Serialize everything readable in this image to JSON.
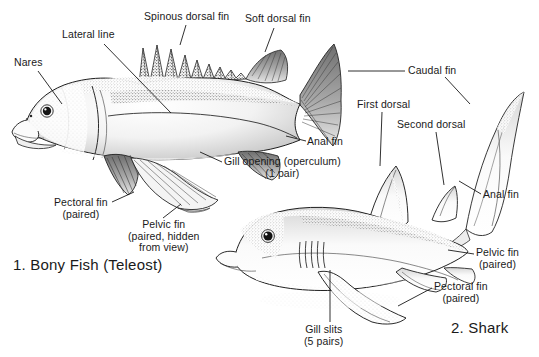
{
  "figure": {
    "background_color": "#ffffff",
    "ink_color": "#1a1a1a"
  },
  "captions": {
    "bony_fish": "1. Bony Fish (Teleost)",
    "shark": "2. Shark"
  },
  "labels": {
    "nares": "Nares",
    "lateral_line": "Lateral line",
    "spinous_dorsal_fin": "Spinous dorsal fin",
    "soft_dorsal_fin": "Soft dorsal fin",
    "caudal_fin": "Caudal fin",
    "anal_fin_bony": "Anal fin",
    "gill_opening_line1": "Gill opening (operculum)",
    "gill_opening_line2": "(1 pair)",
    "pectoral_fin_bony_line1": "Pectoral fin",
    "pectoral_fin_bony_line2": "(paired)",
    "pelvic_fin_bony_line1": "Pelvic fin",
    "pelvic_fin_bony_line2": "(paired, hidden",
    "pelvic_fin_bony_line3": "from view)",
    "first_dorsal": "First dorsal",
    "second_dorsal": "Second dorsal",
    "anal_fin_shark": "Anal fin",
    "pelvic_fin_shark_line1": "Pelvic fin",
    "pelvic_fin_shark_line2": "(paired)",
    "pectoral_fin_shark_line1": "Pectoral fin",
    "pectoral_fin_shark_line2": "(paired)",
    "gill_slits_line1": "Gill slits",
    "gill_slits_line2": "(5 pairs)"
  }
}
